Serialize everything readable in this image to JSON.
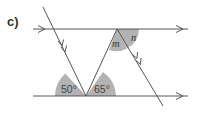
{
  "part_label": "c)",
  "diagram": {
    "type": "parallel-lines-angles",
    "colors": {
      "line": "#555555",
      "shade": "#b3b3b3"
    },
    "angles": {
      "bottom_left": "50°",
      "bottom_right": "65°",
      "top_m": "m",
      "top_n": "n"
    }
  }
}
